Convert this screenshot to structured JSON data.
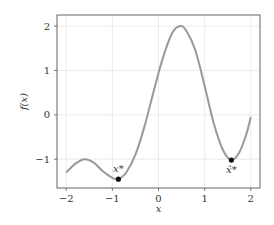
{
  "chart_data": {
    "type": "line",
    "title": "",
    "xlabel": "x",
    "ylabel": "f(x)",
    "xlim": [
      -2.2,
      2.2
    ],
    "ylim": [
      -1.65,
      2.25
    ],
    "xticks": [
      "-2",
      "-1",
      "0",
      "1",
      "2"
    ],
    "yticks": [
      "-1",
      "0",
      "1",
      "2"
    ],
    "grid": true,
    "series": [
      {
        "name": "f(x)",
        "color": "#999999",
        "x": [
          -2.0,
          -1.8,
          -1.6,
          -1.4,
          -1.2,
          -1.0,
          -0.87,
          -0.7,
          -0.5,
          -0.3,
          -0.1,
          0.1,
          0.3,
          0.47,
          0.6,
          0.8,
          1.0,
          1.2,
          1.4,
          1.58,
          1.75,
          1.9,
          2.0
        ],
        "y": [
          -1.3,
          -1.1,
          -1.0,
          -1.08,
          -1.28,
          -1.42,
          -1.45,
          -1.3,
          -0.9,
          -0.25,
          0.55,
          1.3,
          1.85,
          2.0,
          1.9,
          1.45,
          0.65,
          -0.2,
          -0.8,
          -1.02,
          -0.85,
          -0.45,
          -0.05
        ]
      }
    ],
    "annotations": [
      {
        "label": "x*",
        "x": -0.87,
        "y": -1.45
      },
      {
        "label": "x̂*",
        "x": 1.58,
        "y": -1.02
      }
    ]
  }
}
